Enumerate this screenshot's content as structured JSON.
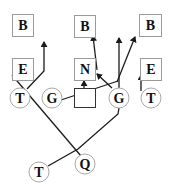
{
  "diagram": {
    "type": "football-play",
    "colors": {
      "line": "#1a1a1a",
      "box_border": "#9a9a9a",
      "circle_border": "#a8a8a8",
      "text": "#111111",
      "background": "#ffffff"
    },
    "boxes": [
      {
        "id": "b-left",
        "label": "B",
        "x": 12,
        "y": 14,
        "w": 21,
        "h": 22
      },
      {
        "id": "b-mid",
        "label": "B",
        "x": 74,
        "y": 15,
        "w": 21,
        "h": 22
      },
      {
        "id": "b-right",
        "label": "B",
        "x": 139,
        "y": 14,
        "w": 22,
        "h": 22
      },
      {
        "id": "e-left",
        "label": "E",
        "x": 12,
        "y": 58,
        "w": 21,
        "h": 22
      },
      {
        "id": "n-mid",
        "label": "N",
        "x": 74,
        "y": 58,
        "w": 21,
        "h": 22
      },
      {
        "id": "e-right",
        "label": "E",
        "x": 140,
        "y": 58,
        "w": 21,
        "h": 22
      }
    ],
    "circles": [
      {
        "id": "t-left",
        "label": "T",
        "cx": 20,
        "cy": 98,
        "r": 10
      },
      {
        "id": "g-left",
        "label": "G",
        "cx": 52,
        "cy": 98,
        "r": 10
      },
      {
        "id": "g-right",
        "label": "G",
        "cx": 119,
        "cy": 98,
        "r": 10
      },
      {
        "id": "t-right",
        "label": "T",
        "cx": 151,
        "cy": 98,
        "r": 10
      },
      {
        "id": "t-bottom",
        "label": "T",
        "cx": 39,
        "cy": 172,
        "r": 10
      },
      {
        "id": "q",
        "label": "Q",
        "cx": 85,
        "cy": 164,
        "r": 10
      }
    ],
    "center_square": {
      "id": "center",
      "label": "",
      "x": 74,
      "y": 88,
      "w": 21,
      "h": 19
    }
  }
}
